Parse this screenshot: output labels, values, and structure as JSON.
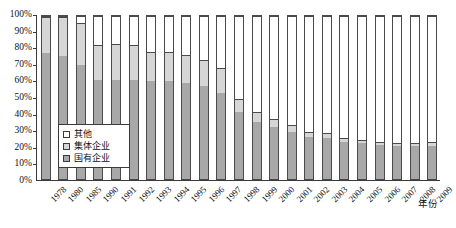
{
  "chart_data": {
    "type": "bar",
    "stacked": true,
    "stack_mode": "percent",
    "title": "",
    "subtitle": "",
    "xlabel": "年份",
    "ylabel": "",
    "ylim": [
      0,
      100
    ],
    "ytick_labels": [
      "0%",
      "10%",
      "20%",
      "30%",
      "40%",
      "50%",
      "60%",
      "70%",
      "80%",
      "90%",
      "100%"
    ],
    "ytick_values": [
      0,
      10,
      20,
      30,
      40,
      50,
      60,
      70,
      80,
      90,
      100
    ],
    "grid": false,
    "legend_position": "inside-bottom-left",
    "categories": [
      "1978",
      "1980",
      "1985",
      "1990",
      "1991",
      "1992",
      "1993",
      "1994",
      "1995",
      "1996",
      "1997",
      "1998",
      "1999",
      "2000",
      "2001",
      "2002",
      "2003",
      "2004",
      "2005",
      "2006",
      "2007",
      "2008",
      "2009"
    ],
    "series": [
      {
        "name": "国有企业",
        "color": "#a8a8a8",
        "values": [
          78,
          76,
          70,
          61,
          61,
          61,
          60,
          60,
          59,
          57,
          53,
          41,
          35,
          32,
          29,
          26,
          25,
          23,
          22,
          21,
          20,
          20,
          20
        ]
      },
      {
        "name": "集体企业",
        "color": "#d6d6d6",
        "values": [
          22,
          24,
          26,
          21,
          22,
          21,
          18,
          18,
          17,
          16,
          15,
          8,
          6,
          5,
          4,
          3,
          3,
          2,
          2,
          2,
          2,
          2,
          3
        ]
      },
      {
        "name": "其他",
        "color": "#ffffff",
        "values": [
          0,
          0,
          4,
          18,
          17,
          18,
          22,
          22,
          24,
          27,
          32,
          51,
          59,
          63,
          67,
          71,
          72,
          75,
          76,
          77,
          78,
          78,
          77
        ]
      }
    ],
    "cumulative_tops": {
      "国有企业": [
        78,
        76,
        70,
        61,
        61,
        61,
        60,
        60,
        59,
        57,
        53,
        41,
        35,
        32,
        29,
        26,
        25,
        23,
        22,
        21,
        20,
        20,
        20
      ],
      "集体企业": [
        100,
        100,
        96,
        82,
        83,
        82,
        78,
        78,
        76,
        73,
        68,
        49,
        41,
        37,
        33,
        29,
        28,
        25,
        24,
        23,
        22,
        22,
        23
      ]
    },
    "legend": [
      {
        "label": "其他",
        "color": "#ffffff",
        "swatch": "square-outline"
      },
      {
        "label": "集体企业",
        "color": "#d6d6d6",
        "swatch": "square-light-gray"
      },
      {
        "label": "国有企业",
        "color": "#a8a8a8",
        "swatch": "square-dark-gray"
      }
    ]
  },
  "axis": {
    "x_title": "年份"
  },
  "colors": {
    "state": "#a8a8a8",
    "collective": "#d6d6d6",
    "other": "#ffffff",
    "outline": "#4a4a4a",
    "axis": "#3a3a3a",
    "text": "#111111"
  }
}
